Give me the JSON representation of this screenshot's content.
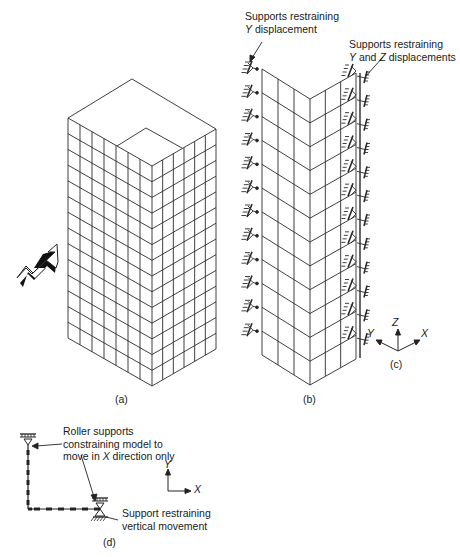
{
  "figure": {
    "panels": [
      {
        "id": "a",
        "caption": "(a)",
        "description": "Isometric view of tall building with floor/column grid and wind arrow"
      },
      {
        "id": "b",
        "caption": "(b)",
        "description": "Two perpendicular faces of the building model with supports"
      },
      {
        "id": "c",
        "caption": "(c)",
        "description": "Global coordinate axes"
      },
      {
        "id": "d",
        "caption": "(d)",
        "description": "Plan-frame model with roller supports"
      }
    ],
    "panel_b": {
      "label_left_line1": "Supports restraining",
      "label_left_line2_axis": "Y",
      "label_left_line2_rest": " displacement",
      "label_right_line1": "Supports restraining",
      "label_right_line2_axis1": "Y",
      "label_right_line2_mid": " and ",
      "label_right_line2_axis2": "Z",
      "label_right_line2_rest": " displacements"
    },
    "panel_c": {
      "axis_z": "Z",
      "axis_y": "Y",
      "axis_x": "X"
    },
    "panel_d": {
      "roller_label_line1": "Roller supports",
      "roller_label_line2": "constraining model to",
      "roller_label_line3_pre": "move in ",
      "roller_label_line3_axis": "X",
      "roller_label_line3_post": " direction only",
      "support_label_line1": "Support restraining",
      "support_label_line2": "vertical movement",
      "axis_y": "Y",
      "axis_x": "X"
    },
    "colors": {
      "line": "#2a2a2a",
      "background": "#ffffff"
    }
  }
}
